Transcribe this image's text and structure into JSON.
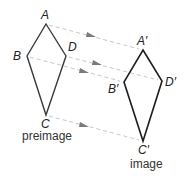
{
  "diagram": {
    "preimage": {
      "caption": "preimage",
      "vertices": {
        "A": {
          "label": "A",
          "x": 46,
          "y": 24
        },
        "B": {
          "label": "B",
          "x": 27,
          "y": 56
        },
        "C": {
          "label": "C",
          "x": 46,
          "y": 115
        },
        "D": {
          "label": "D",
          "x": 66,
          "y": 56
        }
      }
    },
    "image": {
      "caption": "image",
      "vertices": {
        "A": {
          "label": "A′",
          "x": 143,
          "y": 50
        },
        "B": {
          "label": "B′",
          "x": 124,
          "y": 82
        },
        "C": {
          "label": "C′",
          "x": 143,
          "y": 141
        },
        "D": {
          "label": "D′",
          "x": 162,
          "y": 81
        }
      }
    },
    "translation_arrows": [
      {
        "from": "A",
        "to": "A′"
      },
      {
        "from": "B",
        "to": "B′"
      },
      {
        "from": "C",
        "to": "C′"
      },
      {
        "from": "D",
        "to": "D′"
      }
    ],
    "colors": {
      "shape_stroke": "#1e1e1e",
      "guide_line": "#c8c8c8",
      "arrowhead": "#7a7a7a",
      "label": "#222222"
    }
  }
}
